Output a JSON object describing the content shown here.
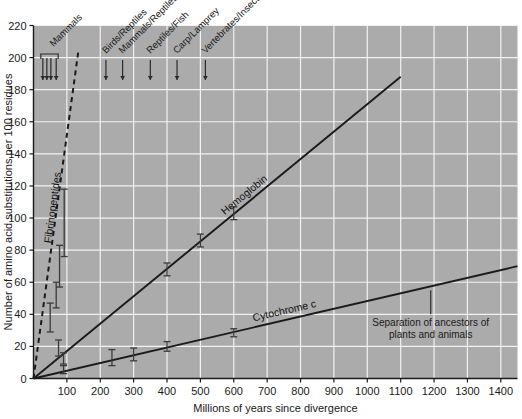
{
  "chart_data": {
    "type": "line",
    "title": "",
    "xlabel": "Millions of years since divergence",
    "ylabel": "Number of amino acid substitutions per 100 residues",
    "xlim": [
      0,
      1450
    ],
    "ylim": [
      0,
      220
    ],
    "xticks": [
      100,
      200,
      300,
      400,
      500,
      600,
      700,
      800,
      900,
      1000,
      1100,
      1200,
      1300,
      1400
    ],
    "xtick_labels": [
      "100",
      "200",
      "300",
      "400",
      "500",
      "600",
      "700",
      "800",
      "900",
      "1000",
      "1100",
      "1200",
      "1300",
      "1400"
    ],
    "yticks": [
      0,
      20,
      40,
      60,
      80,
      100,
      120,
      140,
      160,
      180,
      200,
      220
    ],
    "ytick_labels": [
      "0",
      "20",
      "40",
      "60",
      "80",
      "100",
      "120",
      "140",
      "160",
      "180",
      "200",
      "220"
    ],
    "grid": true,
    "plot_bg": "#ababab",
    "grid_color": "#f2f2f2",
    "line_color": "#1a1a1a",
    "legend_position": "inline-labels",
    "series": [
      {
        "name": "Fibrinopeptides",
        "style": "dashed",
        "label": "Fibrinopeptides",
        "fit_line": [
          [
            0,
            0
          ],
          [
            135,
            205
          ]
        ],
        "points": [
          {
            "x": 50,
            "y": 38,
            "err_low": 29,
            "err_high": 47
          },
          {
            "x": 68,
            "y": 52,
            "err_low": 44,
            "err_high": 60
          },
          {
            "x": 78,
            "y": 70,
            "err_low": 57,
            "err_high": 83
          },
          {
            "x": 92,
            "y": 96,
            "err_low": 76,
            "err_high": 118
          }
        ]
      },
      {
        "name": "Hemoglobin",
        "style": "solid",
        "label": "Hemoglobin",
        "fit_line": [
          [
            0,
            0
          ],
          [
            1100,
            188
          ]
        ],
        "points": [
          {
            "x": 75,
            "y": 19,
            "err_low": 14,
            "err_high": 24
          },
          {
            "x": 90,
            "y": 12,
            "err_low": 9,
            "err_high": 16
          },
          {
            "x": 400,
            "y": 68,
            "err_low": 64,
            "err_high": 72
          },
          {
            "x": 500,
            "y": 86,
            "err_low": 82,
            "err_high": 90
          },
          {
            "x": 600,
            "y": 103,
            "err_low": 99,
            "err_high": 107
          }
        ]
      },
      {
        "name": "Cytochrome c",
        "style": "solid",
        "label": "Cytochrome c",
        "fit_line": [
          [
            0,
            0
          ],
          [
            1450,
            70
          ]
        ],
        "points": [
          {
            "x": 90,
            "y": 5,
            "err_low": 3,
            "err_high": 8
          },
          {
            "x": 235,
            "y": 13,
            "err_low": 8,
            "err_high": 18
          },
          {
            "x": 300,
            "y": 15,
            "err_low": 11,
            "err_high": 19
          },
          {
            "x": 400,
            "y": 20,
            "err_low": 17,
            "err_high": 23
          },
          {
            "x": 600,
            "y": 28,
            "err_low": 26,
            "err_high": 31
          }
        ]
      }
    ],
    "annotations": [
      {
        "label": "Mammals",
        "x": 56,
        "type": "bracket",
        "arrows_x": [
          28,
          40,
          52,
          68
        ]
      },
      {
        "label": "Birds/Reptiles",
        "x": 217
      },
      {
        "label": "Mammals/Reptiles",
        "x": 267
      },
      {
        "label": "Reptiles/Fish",
        "x": 350
      },
      {
        "label": "Carp/Lamprey",
        "x": 430
      },
      {
        "label": "Vertebrates/Insects",
        "x": 515
      },
      {
        "label": "Separation of ancestors of plants and animals",
        "x": 1190,
        "type": "tick-note",
        "line1": "Separation of ancestors of",
        "line2": "plants and animals"
      }
    ]
  }
}
